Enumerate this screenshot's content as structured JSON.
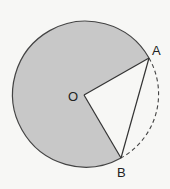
{
  "diagram": {
    "center_label": "O",
    "point_a_label": "A",
    "point_b_label": "B",
    "fill_color": "#c8c8c8",
    "stroke_color": "#444444"
  }
}
